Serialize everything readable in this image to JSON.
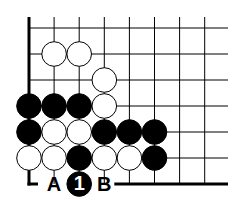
{
  "diagram": {
    "type": "go-board-problem",
    "grid": {
      "columns": 8,
      "rows": 7,
      "origin_x": 29,
      "origin_y": 28,
      "step_x": 25.1,
      "step_y": 26,
      "right_end": 228,
      "top_start": 17
    },
    "edges": [
      "left",
      "bottom"
    ],
    "stones": [
      {
        "color": "white",
        "col": 1,
        "row": 1
      },
      {
        "color": "white",
        "col": 2,
        "row": 1
      },
      {
        "color": "white",
        "col": 3,
        "row": 2
      },
      {
        "color": "black",
        "col": 0,
        "row": 3
      },
      {
        "color": "black",
        "col": 1,
        "row": 3
      },
      {
        "color": "black",
        "col": 2,
        "row": 3
      },
      {
        "color": "white",
        "col": 3,
        "row": 3
      },
      {
        "color": "black",
        "col": 0,
        "row": 4
      },
      {
        "color": "white",
        "col": 1,
        "row": 4
      },
      {
        "color": "white",
        "col": 2,
        "row": 4
      },
      {
        "color": "black",
        "col": 3,
        "row": 4
      },
      {
        "color": "black",
        "col": 4,
        "row": 4
      },
      {
        "color": "black",
        "col": 5,
        "row": 4
      },
      {
        "color": "white",
        "col": 0,
        "row": 5
      },
      {
        "color": "white",
        "col": 1,
        "row": 5
      },
      {
        "color": "black",
        "col": 2,
        "row": 5
      },
      {
        "color": "white",
        "col": 3,
        "row": 5
      },
      {
        "color": "white",
        "col": 4,
        "row": 5
      },
      {
        "color": "black",
        "col": 5,
        "row": 5
      }
    ],
    "move": {
      "color": "black",
      "col": 2,
      "row": 6,
      "number": "1"
    },
    "labels": [
      {
        "text": "A",
        "col": 1,
        "row": 6
      },
      {
        "text": "B",
        "col": 3,
        "row": 6
      }
    ]
  }
}
